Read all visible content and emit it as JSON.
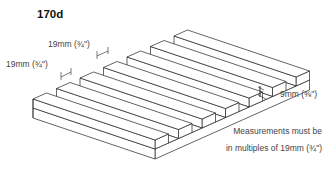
{
  "title": "170d",
  "labels": {
    "ridge_width_top": "19mm (¾\")",
    "groove_width": "19mm (¾\")",
    "groove_depth": "9mm (⅜\")"
  },
  "note": {
    "line1": "Measurements must be",
    "line2": "in multiples of 19mm (¾\")"
  },
  "diagram": {
    "ridge_count": 7,
    "line_color": "#222222",
    "fill_color": "#ffffff"
  }
}
